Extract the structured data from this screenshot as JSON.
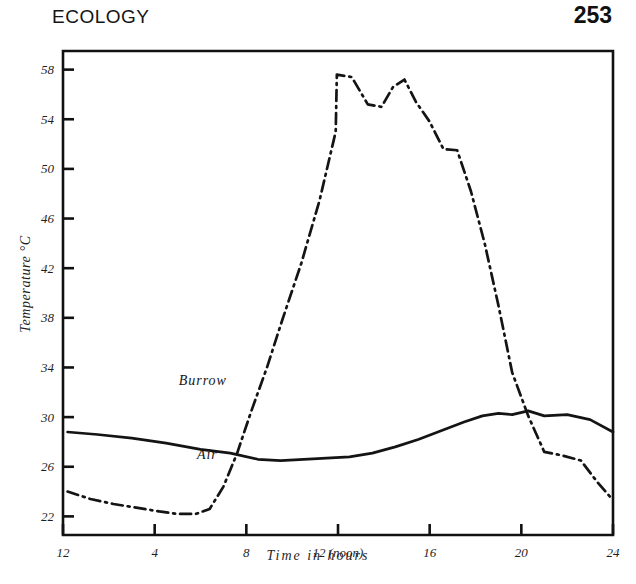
{
  "header": {
    "title": "ECOLOGY",
    "page_number": "253"
  },
  "chart_data": {
    "type": "line",
    "title": "",
    "xlabel": "Time in hours",
    "ylabel": "Temperature °C",
    "xlim": [
      12,
      36
    ],
    "ylim": [
      20.5,
      59.5
    ],
    "grid": false,
    "legend": "inline-labels",
    "xtick_values": [
      12,
      16,
      20,
      24,
      28,
      32,
      36
    ],
    "xtick_labels": [
      "12",
      "4",
      "8",
      "12 (noon)",
      "16",
      "20",
      "24"
    ],
    "ytick_values": [
      22,
      26,
      30,
      34,
      38,
      42,
      46,
      50,
      54,
      58
    ],
    "ytick_labels": [
      "22",
      "26",
      "30",
      "34",
      "38",
      "42",
      "46",
      "50",
      "54",
      "58"
    ],
    "series": [
      {
        "name": "Burrow",
        "style": "solid",
        "color": "#141414",
        "label_x": 18.1,
        "label_y": 32.6,
        "x": [
          12.2,
          13.5,
          15.0,
          16.5,
          18.0,
          19.3,
          20.5,
          21.5,
          22.5,
          23.5,
          24.5,
          25.5,
          26.5,
          27.5,
          28.5,
          29.5,
          30.3,
          31.0,
          31.6,
          32.3,
          33.0,
          34.0,
          35.0,
          36.0
        ],
        "y": [
          28.8,
          28.6,
          28.3,
          27.9,
          27.4,
          27.1,
          26.6,
          26.5,
          26.6,
          26.7,
          26.8,
          27.1,
          27.6,
          28.2,
          28.9,
          29.6,
          30.1,
          30.3,
          30.2,
          30.5,
          30.1,
          30.2,
          29.8,
          28.8
        ]
      },
      {
        "name": "Air",
        "style": "dash-dot",
        "color": "#141414",
        "label_x": 18.3,
        "label_y": 26.6,
        "x": [
          12.2,
          13.2,
          14.2,
          15.2,
          16.2,
          17.0,
          17.8,
          18.4,
          19.0,
          19.6,
          20.2,
          20.9,
          21.6,
          22.4,
          23.2,
          23.9,
          23.95,
          24.6,
          25.3,
          25.9,
          26.4,
          26.9,
          27.4,
          28.0,
          28.6,
          29.2,
          29.8,
          30.4,
          31.0,
          31.6,
          32.3,
          33.0,
          33.8,
          34.6,
          35.3,
          36.0
        ],
        "y": [
          24.0,
          23.4,
          23.0,
          22.7,
          22.4,
          22.2,
          22.2,
          22.6,
          24.4,
          27.1,
          30.4,
          34.0,
          38.0,
          42.4,
          47.5,
          53.0,
          57.6,
          57.4,
          55.2,
          55.0,
          56.6,
          57.2,
          55.4,
          53.8,
          51.6,
          51.5,
          48.2,
          44.0,
          39.0,
          33.6,
          30.1,
          27.2,
          26.9,
          26.5,
          24.8,
          23.3
        ]
      }
    ]
  }
}
